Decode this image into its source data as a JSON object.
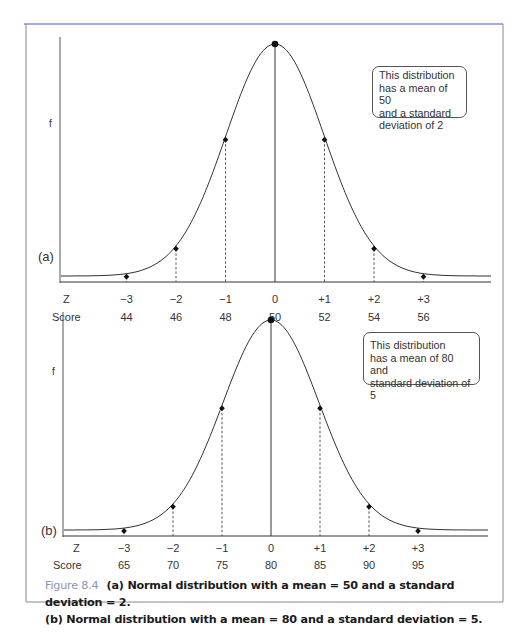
{
  "figure": {
    "label": "Figure 8.4",
    "caption_line1": "(a) Normal distribution with a mean = 50 and a standard deviation = 2.",
    "caption_line2": "(b) Normal distribution with a mean =  80 and a standard deviation = 5.",
    "label_color": "#8a93b8",
    "frame_top_color": "#8c8ce0"
  },
  "chart_data": [
    {
      "type": "line",
      "panel": "(a)",
      "title": "Normal distribution with a mean = 50 and a standard deviation = 2",
      "ylabel": "f",
      "xlabel_rows": [
        "Z",
        "Score"
      ],
      "z": [
        -3,
        -2,
        -1,
        0,
        1,
        2,
        3
      ],
      "z_labels": [
        "−3",
        "−2",
        "−1",
        "0",
        "+1",
        "+2",
        "+3"
      ],
      "scores": [
        44,
        46,
        48,
        50,
        52,
        54,
        56
      ],
      "mean": 50,
      "sd": 2,
      "annotation": [
        "This distribution",
        "has a mean of 50",
        "and a standard",
        "deviation of 2"
      ]
    },
    {
      "type": "line",
      "panel": "(b)",
      "title": "Normal distribution with a mean = 80 and a standard deviation = 5",
      "ylabel": "f",
      "xlabel_rows": [
        "Z",
        "Score"
      ],
      "z": [
        -3,
        -2,
        -1,
        0,
        1,
        2,
        3
      ],
      "z_labels": [
        "−3",
        "−2",
        "−1",
        "0",
        "+1",
        "+2",
        "+3"
      ],
      "scores": [
        65,
        70,
        75,
        80,
        85,
        90,
        95
      ],
      "mean": 80,
      "sd": 5,
      "annotation": [
        "This distribution",
        "has a mean of 80 and",
        "standard deviation of 5"
      ]
    }
  ]
}
